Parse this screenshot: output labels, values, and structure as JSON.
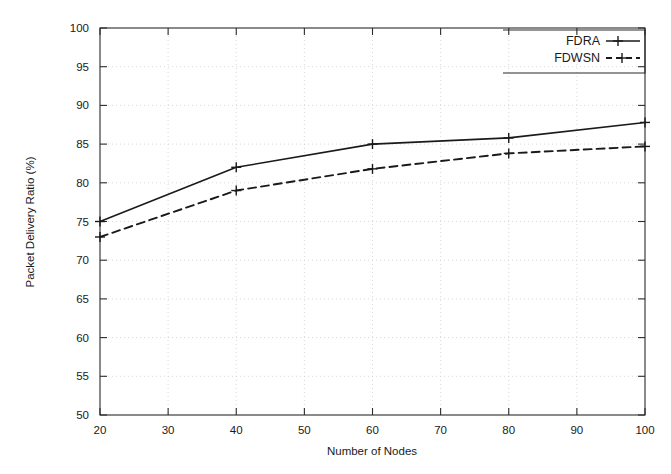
{
  "chart_data": {
    "type": "line",
    "title": "",
    "xlabel": "Number of Nodes",
    "ylabel": "Packet Delivery Ratio (%)",
    "x": [
      20,
      40,
      60,
      80,
      100
    ],
    "xlim": [
      20,
      100
    ],
    "ylim": [
      50,
      100
    ],
    "xticks": [
      20,
      30,
      40,
      50,
      60,
      70,
      80,
      90,
      100
    ],
    "yticks": [
      50,
      55,
      60,
      65,
      70,
      75,
      80,
      85,
      90,
      95,
      100
    ],
    "grid": true,
    "legend_position": "top-right",
    "series": [
      {
        "name": "FDRA",
        "values": [
          75.0,
          82.0,
          85.0,
          85.8,
          87.8
        ],
        "style": "solid",
        "marker": "plus",
        "color": "#1a1a1a"
      },
      {
        "name": "FDWSN",
        "values": [
          73.0,
          79.0,
          81.8,
          83.8,
          84.7
        ],
        "style": "dashed",
        "marker": "plus",
        "color": "#1a1a1a"
      }
    ]
  },
  "axes": {
    "x_tick_labels": [
      "20",
      "30",
      "40",
      "50",
      "60",
      "70",
      "80",
      "90",
      "100"
    ],
    "y_tick_labels": [
      "50",
      "55",
      "60",
      "65",
      "70",
      "75",
      "80",
      "85",
      "90",
      "95",
      "100"
    ],
    "x_axis_title": "Number of Nodes",
    "y_axis_title": "Packet Delivery Ratio (%)"
  },
  "legend": {
    "entries": [
      {
        "label": "FDRA",
        "style": "solid"
      },
      {
        "label": "FDWSN",
        "style": "dashed"
      }
    ]
  }
}
